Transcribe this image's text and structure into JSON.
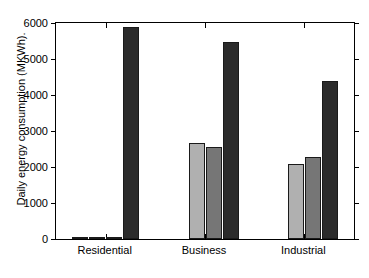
{
  "chart_data": {
    "type": "bar",
    "title": "",
    "xlabel": "",
    "ylabel": "Daily energy consumption (MKWh).",
    "categories": [
      "Residential",
      "Business",
      "Industrial"
    ],
    "ylim": [
      0,
      6000
    ],
    "yticks": [
      0,
      1000,
      2000,
      3000,
      4000,
      5000,
      6000
    ],
    "ytick_labels": [
      "0",
      "1000",
      "2000",
      "3000",
      "4000",
      "5000",
      "6000"
    ],
    "grid": false,
    "legend": "none",
    "series": [
      {
        "name": "series-1",
        "color": "#ffffff",
        "values": [
          60,
          0,
          0
        ]
      },
      {
        "name": "series-2",
        "color": "#b0b0b0",
        "values": [
          55,
          2680,
          2070
        ]
      },
      {
        "name": "series-3",
        "color": "#767676",
        "values": [
          40,
          2560,
          2270
        ]
      },
      {
        "name": "series-4",
        "color": "#2b2b2b",
        "values": [
          5900,
          5480,
          4380
        ]
      }
    ]
  },
  "axes": {
    "y_title": "Daily energy consumption (MKWh).",
    "tick_0": "0",
    "tick_1000": "1000",
    "tick_2000": "2000",
    "tick_3000": "3000",
    "tick_4000": "4000",
    "tick_5000": "5000",
    "tick_6000": "6000",
    "cat_0": "Residential",
    "cat_1": "Business",
    "cat_2": "Industrial"
  },
  "colors": {
    "axis": "#000000",
    "bar_edge": "#1a1a1a",
    "background": "#ffffff"
  }
}
